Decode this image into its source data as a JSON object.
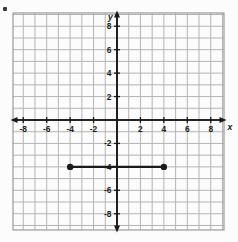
{
  "figure": {
    "kind": "coordinate-plane",
    "axis_labels": {
      "x": "x",
      "y": "y"
    },
    "background_color": "#fcfcfc",
    "grid_color": "#b4b4b4",
    "axis_color": "#1a1a1a",
    "segment_color": "#1a1a1a"
  },
  "chart_data": {
    "type": "scatter",
    "title": "",
    "subtitle": "",
    "xlabel": "x",
    "ylabel": "y",
    "xlim": [
      -9,
      9
    ],
    "ylim": [
      -9,
      9
    ],
    "grid": true,
    "grid_step": 1,
    "tick_step": 2,
    "legend": null,
    "xticks": [
      -8,
      -6,
      -4,
      -2,
      2,
      4,
      6,
      8
    ],
    "yticks": [
      8,
      6,
      4,
      2,
      -2,
      -4,
      -6,
      -8
    ],
    "xticklabels": [
      "-8",
      "-6",
      "-4",
      "-2",
      "2",
      "4",
      "6",
      "8"
    ],
    "yticklabels": [
      "8",
      "6",
      "4",
      "2",
      "-2",
      "-4",
      "-6",
      "-8"
    ],
    "series": [
      {
        "name": "segment",
        "type": "line-segment",
        "endpoints_filled": true,
        "x": [
          -4,
          4
        ],
        "y": [
          -4,
          -4
        ],
        "points": [
          {
            "label": "",
            "x": -4,
            "y": -4
          },
          {
            "label": "",
            "x": 4,
            "y": -4
          }
        ]
      }
    ],
    "annotations": []
  }
}
